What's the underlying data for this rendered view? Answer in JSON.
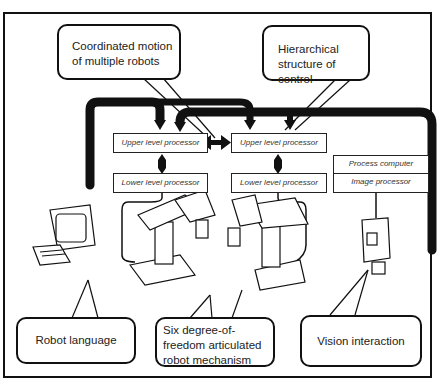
{
  "diagram": {
    "callouts": {
      "coordinated_motion": "Coordinated motion of multiple robots",
      "hierarchical_control": "Hierarchical structure of control",
      "robot_language": "Robot language",
      "six_dof": "Six degree-of-freedom articulated robot mechanism",
      "vision": "Vision interaction"
    },
    "processors": {
      "left_upper": "Upper level processor",
      "left_lower": "Lower level processor",
      "right_upper": "Upper level processor",
      "right_lower": "Lower level processor",
      "process_computer": "Process computer",
      "image_processor": "Image processor"
    },
    "components": [
      "terminal",
      "robot-arm-left",
      "robot-arm-right",
      "camera"
    ]
  }
}
